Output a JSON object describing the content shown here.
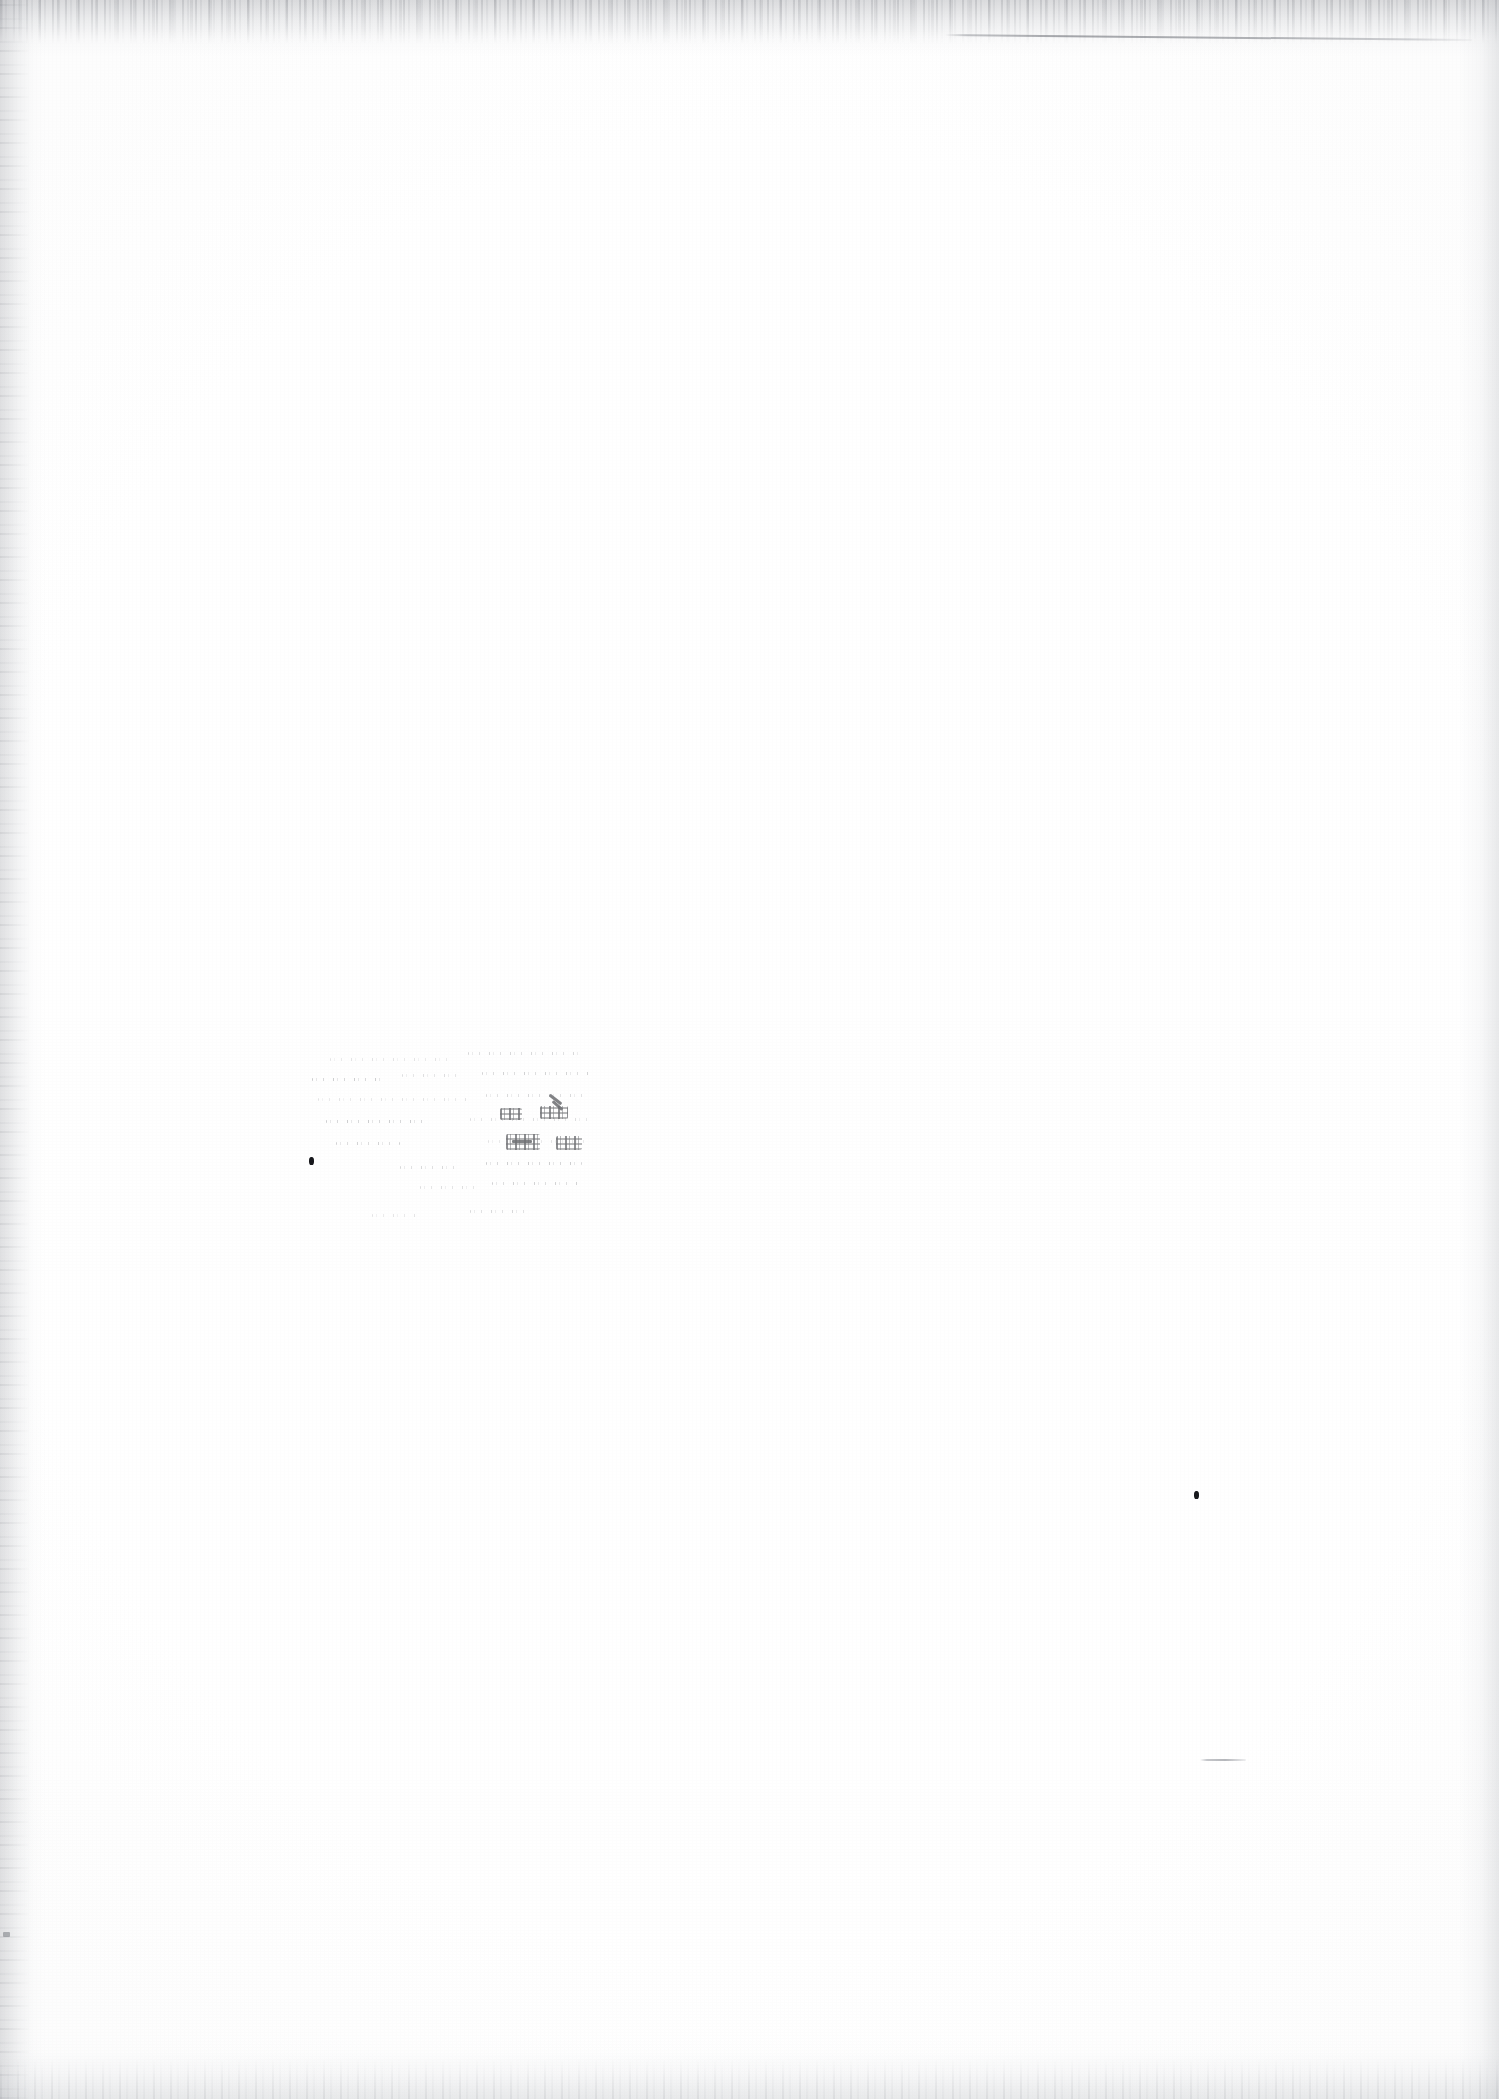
{
  "document": {
    "kind": "scanned-page",
    "page_state": "blank",
    "visible_text": "",
    "note": "No legible text rendered on this page",
    "paper_color": "#ffffff",
    "ink_color": "#17181c",
    "edge_shadow_color": "#96989e",
    "width_px": 1499,
    "height_px": 2099
  },
  "marks": {
    "rule_line": {
      "name": "horizontal-rule",
      "x": 945,
      "y": 34,
      "width": 527,
      "angle_deg": 0.55,
      "color": "#5f6269"
    },
    "ghost_text_block": {
      "name": "faded-ghost-text",
      "x": 308,
      "y": 1046,
      "width": 300,
      "height": 190,
      "legible": false,
      "rows": [
        {
          "x": 330,
          "y": 1058,
          "width": 118
        },
        {
          "x": 468,
          "y": 1052,
          "width": 112
        },
        {
          "x": 312,
          "y": 1078,
          "width": 74
        },
        {
          "x": 402,
          "y": 1074,
          "width": 62
        },
        {
          "x": 482,
          "y": 1072,
          "width": 108
        },
        {
          "x": 318,
          "y": 1098,
          "width": 150
        },
        {
          "x": 486,
          "y": 1094,
          "width": 104
        },
        {
          "x": 326,
          "y": 1120,
          "width": 104
        },
        {
          "x": 470,
          "y": 1118,
          "width": 120
        },
        {
          "x": 336,
          "y": 1142,
          "width": 64
        },
        {
          "x": 488,
          "y": 1140,
          "width": 104
        },
        {
          "x": 400,
          "y": 1166,
          "width": 58
        },
        {
          "x": 486,
          "y": 1162,
          "width": 96
        },
        {
          "x": 420,
          "y": 1186,
          "width": 62
        },
        {
          "x": 492,
          "y": 1182,
          "width": 88
        },
        {
          "x": 372,
          "y": 1214,
          "width": 46
        },
        {
          "x": 470,
          "y": 1210,
          "width": 62
        }
      ],
      "dense_patches": [
        {
          "x": 506,
          "y": 1134,
          "width": 34,
          "height": 16
        },
        {
          "x": 556,
          "y": 1136,
          "width": 26,
          "height": 14
        },
        {
          "x": 500,
          "y": 1108,
          "width": 22,
          "height": 12
        },
        {
          "x": 540,
          "y": 1106,
          "width": 28,
          "height": 13
        }
      ],
      "strokes": [
        {
          "x": 548,
          "y": 1098,
          "width": 15,
          "height": 3,
          "angle_deg": 38
        },
        {
          "x": 551,
          "y": 1104,
          "width": 13,
          "height": 3,
          "angle_deg": 42
        },
        {
          "x": 512,
          "y": 1140,
          "width": 20,
          "height": 3,
          "angle_deg": 0
        }
      ]
    },
    "specks": [
      {
        "name": "ink-speck-left",
        "x": 309,
        "y": 1157,
        "width": 5,
        "height": 8
      },
      {
        "name": "ink-speck-right",
        "x": 1194,
        "y": 1491,
        "width": 5,
        "height": 8
      }
    ],
    "dash": {
      "name": "short-dash-mark",
      "x": 1200,
      "y": 1759,
      "width": 46
    },
    "faint_edge_mark": {
      "name": "left-edge-mark",
      "x": 3,
      "y": 1932,
      "width": 7,
      "height": 5
    }
  }
}
